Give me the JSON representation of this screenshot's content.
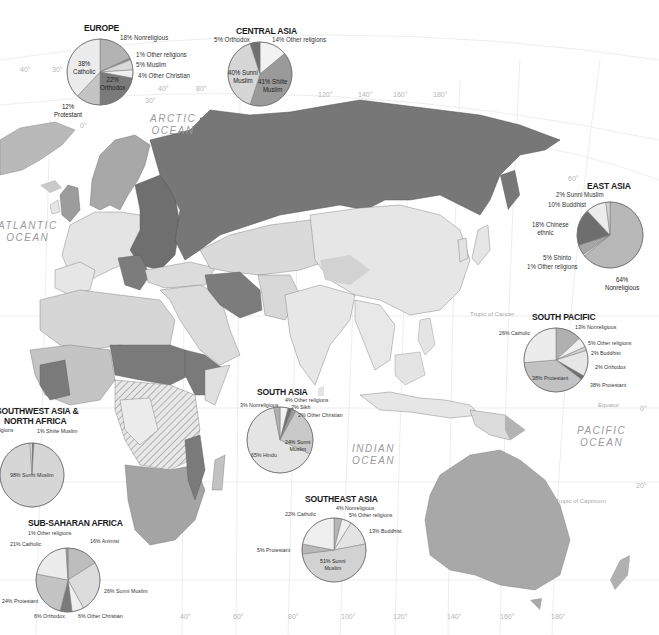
{
  "map": {
    "colors": {
      "water": "#ffffff",
      "land_light": "#e9e9e9",
      "land_mid": "#c9c9c9",
      "land_mid2": "#b4b4b4",
      "land_dark": "#7e7e7e",
      "border": "#6e6e6e",
      "grid": "#e6e6e6"
    },
    "oceans": [
      {
        "id": "arctic",
        "line1": "ARCTIC",
        "line2": "OCEAN"
      },
      {
        "id": "atlantic",
        "line1": "ATLANTIC",
        "line2": "OCEAN"
      },
      {
        "id": "indian",
        "line1": "INDIAN",
        "line2": "OCEAN"
      },
      {
        "id": "pacific",
        "line1": "PACIFIC",
        "line2": "OCEAN"
      }
    ],
    "reference_lines": {
      "tropic_cancer": "Tropic of Cancer",
      "equator": "Equator",
      "tropic_capricorn": "Tropic of Capricorn"
    },
    "grid_labels": {
      "top": [
        "40°",
        "30°",
        "40°",
        "80°",
        "30°",
        "0°",
        "120°",
        "140°",
        "160°",
        "180°",
        "60°"
      ],
      "right": [
        "0°",
        "20°",
        "40°"
      ],
      "bottom": [
        "40°",
        "60°",
        "80°",
        "100°",
        "120°",
        "140°",
        "160°",
        "180°"
      ]
    }
  },
  "pies": [
    {
      "id": "europe",
      "title": "EUROPE",
      "slices": [
        {
          "label": "18% Nonreligious",
          "value": 18,
          "color": "#b3b3b3"
        },
        {
          "label": "1% Other religions",
          "value": 1,
          "color": "#8c8c8c"
        },
        {
          "label": "5% Muslim",
          "value": 5,
          "color": "#d9d9d9"
        },
        {
          "label": "4% Other Christian",
          "value": 4,
          "color": "#efefef"
        },
        {
          "label": "22% Orthodox",
          "value": 22,
          "color": "#7a7a7a"
        },
        {
          "label": "12% Protestant",
          "value": 12,
          "color": "#c4c4c4"
        },
        {
          "label": "38% Catholic",
          "value": 38,
          "color": "#ececec"
        }
      ]
    },
    {
      "id": "central-asia",
      "title": "CENTRAL ASIA",
      "slices": [
        {
          "label": "14% Other religions",
          "value": 14,
          "color": "#f2f2f2"
        },
        {
          "label": "41% Shiite Muslim",
          "value": 41,
          "color": "#9a9a9a"
        },
        {
          "label": "40% Sunni Muslim",
          "value": 40,
          "color": "#d6d6d6"
        },
        {
          "label": "5% Orthodox",
          "value": 5,
          "color": "#6f6f6f"
        }
      ]
    },
    {
      "id": "east-asia",
      "title": "EAST ASIA",
      "slices": [
        {
          "label": "64% Nonreligious",
          "value": 64,
          "color": "#b8b8b8"
        },
        {
          "label": "1% Other religions",
          "value": 1,
          "color": "#dcdcdc"
        },
        {
          "label": "5% Shinto",
          "value": 5,
          "color": "#a6a6a6"
        },
        {
          "label": "18% Chinese ethnic",
          "value": 18,
          "color": "#6e6e6e"
        },
        {
          "label": "10% Buddhist",
          "value": 10,
          "color": "#ececec"
        },
        {
          "label": "2% Sunni Muslim",
          "value": 2,
          "color": "#d2d2d2"
        }
      ]
    },
    {
      "id": "south-pacific",
      "title": "SOUTH PACIFIC",
      "slices": [
        {
          "label": "13% Nonreligious",
          "value": 13,
          "color": "#b0b0b0"
        },
        {
          "label": "5% Other religions",
          "value": 5,
          "color": "#efefef"
        },
        {
          "label": "2% Buddhist",
          "value": 2,
          "color": "#d0d0d0"
        },
        {
          "label": "13% Other Christian",
          "value": 13,
          "color": "#e6e6e6"
        },
        {
          "label": "2% Orthodox",
          "value": 2,
          "color": "#6e6e6e"
        },
        {
          "label": "38% Protestant",
          "value": 38,
          "color": "#c2c2c2"
        },
        {
          "label": "26% Catholic",
          "value": 26,
          "color": "#ececec"
        }
      ]
    },
    {
      "id": "southwest-asia",
      "title_line1": "SOUTHWEST ASIA &",
      "title_line2": "NORTH AFRICA",
      "slices": [
        {
          "label": "1% Shiite Muslim",
          "value": 1,
          "color": "#7a7a7a"
        },
        {
          "label": "98% Sunni Muslim",
          "value": 98,
          "color": "#d6d6d6"
        },
        {
          "label": "1% Other religions",
          "value": 1,
          "color": "#efefef"
        }
      ]
    },
    {
      "id": "south-asia",
      "title": "SOUTH ASIA",
      "slices": [
        {
          "label": "4% Other religions",
          "value": 4,
          "color": "#f2f2f2"
        },
        {
          "label": "2% Sikh",
          "value": 2,
          "color": "#6e6e6e"
        },
        {
          "label": "2% Other Christian",
          "value": 2,
          "color": "#9a9a9a"
        },
        {
          "label": "24% Sunni Muslim",
          "value": 24,
          "color": "#c9c9c9"
        },
        {
          "label": "65% Hindu",
          "value": 65,
          "color": "#e4e4e4"
        },
        {
          "label": "3% Nonreligious",
          "value": 3,
          "color": "#b0b0b0"
        }
      ]
    },
    {
      "id": "southeast-asia",
      "title": "SOUTHEAST ASIA",
      "slices": [
        {
          "label": "4% Nonreligious",
          "value": 4,
          "color": "#b5b5b5"
        },
        {
          "label": "5% Other religions",
          "value": 5,
          "color": "#efefef"
        },
        {
          "label": "13% Buddhist",
          "value": 13,
          "color": "#e3e3e3"
        },
        {
          "label": "51% Sunni Muslim",
          "value": 51,
          "color": "#d2d2d2"
        },
        {
          "label": "5% Protestant",
          "value": 5,
          "color": "#b8b8b8"
        },
        {
          "label": "22% Catholic",
          "value": 22,
          "color": "#efefef"
        }
      ]
    },
    {
      "id": "sub-saharan-africa",
      "title": "SUB-SAHARAN AFRICA",
      "slices": [
        {
          "label": "16% Animist",
          "value": 16,
          "color": "#bdbdbd"
        },
        {
          "label": "26% Sunni Muslim",
          "value": 26,
          "color": "#dcdcdc"
        },
        {
          "label": "6% Other Christian",
          "value": 6,
          "color": "#efefef"
        },
        {
          "label": "6% Orthodox",
          "value": 6,
          "color": "#7a7a7a"
        },
        {
          "label": "24% Protestant",
          "value": 24,
          "color": "#c4c4c4"
        },
        {
          "label": "21% Catholic",
          "value": 21,
          "color": "#ececec"
        },
        {
          "label": "1% Other religions",
          "value": 1,
          "color": "#9a9a9a"
        }
      ]
    }
  ],
  "chart_data": [
    {
      "type": "pie",
      "title": "EUROPE",
      "categories": [
        "Catholic",
        "Nonreligious",
        "Other religions",
        "Muslim",
        "Other Christian",
        "Orthodox",
        "Protestant"
      ],
      "values": [
        38,
        18,
        1,
        5,
        4,
        22,
        12
      ]
    },
    {
      "type": "pie",
      "title": "CENTRAL ASIA",
      "categories": [
        "Orthodox",
        "Other religions",
        "Shiite Muslim",
        "Sunni Muslim"
      ],
      "values": [
        5,
        14,
        41,
        40
      ]
    },
    {
      "type": "pie",
      "title": "EAST ASIA",
      "categories": [
        "Sunni Muslim",
        "Buddhist",
        "Chinese ethnic",
        "Shinto",
        "Other religions",
        "Nonreligious"
      ],
      "values": [
        2,
        10,
        18,
        5,
        1,
        64
      ]
    },
    {
      "type": "pie",
      "title": "SOUTH PACIFIC",
      "categories": [
        "Catholic",
        "Nonreligious",
        "Other religions",
        "Buddhist",
        "Other Christian",
        "Orthodox",
        "Protestant"
      ],
      "values": [
        26,
        13,
        5,
        2,
        13,
        2,
        38
      ]
    },
    {
      "type": "pie",
      "title": "SOUTHWEST ASIA & NORTH AFRICA",
      "categories": [
        "Other religions",
        "Shiite Muslim",
        "Sunni Muslim"
      ],
      "values": [
        1,
        1,
        98
      ]
    },
    {
      "type": "pie",
      "title": "SOUTH ASIA",
      "categories": [
        "Nonreligious",
        "Other religions",
        "Sikh",
        "Other Christian",
        "Sunni Muslim",
        "Hindu"
      ],
      "values": [
        3,
        4,
        2,
        2,
        24,
        65
      ]
    },
    {
      "type": "pie",
      "title": "SOUTHEAST ASIA",
      "categories": [
        "Catholic",
        "Nonreligious",
        "Other religions",
        "Buddhist",
        "Protestant",
        "Sunni Muslim"
      ],
      "values": [
        22,
        4,
        5,
        13,
        5,
        51
      ]
    },
    {
      "type": "pie",
      "title": "SUB-SAHARAN AFRICA",
      "categories": [
        "Other religions",
        "Catholic",
        "Animist",
        "Protestant",
        "Sunni Muslim",
        "Orthodox",
        "Other Christian"
      ],
      "values": [
        1,
        21,
        16,
        24,
        26,
        6,
        6
      ]
    }
  ]
}
